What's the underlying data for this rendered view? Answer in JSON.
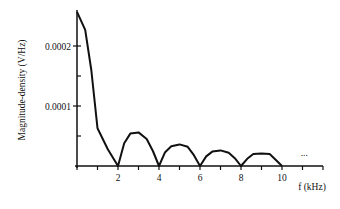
{
  "chart_data": {
    "type": "line",
    "title": "",
    "xlabel": "f (kHz)",
    "ylabel": "Magnitude-density (V/Hz)",
    "xlim": [
      0,
      12
    ],
    "ylim": [
      0,
      0.00026
    ],
    "grid": false,
    "legend": null,
    "x_ticks": [
      0,
      1,
      2,
      3,
      4,
      5,
      6,
      7,
      8,
      9,
      10,
      11,
      12
    ],
    "x_tick_labels": [
      {
        "value": 2,
        "label": "2"
      },
      {
        "value": 4,
        "label": "4"
      },
      {
        "value": 6,
        "label": "6"
      },
      {
        "value": 8,
        "label": "8"
      },
      {
        "value": 10,
        "label": "10"
      }
    ],
    "y_ticks": [
      0,
      5e-05,
      0.0001,
      0.00015,
      0.0002
    ],
    "y_tick_labels": [
      {
        "value": 0.0001,
        "label": "0.0001"
      },
      {
        "value": 0.0002,
        "label": "0.0002"
      }
    ],
    "annotations": [
      {
        "text": "...",
        "x": 10.6,
        "y": 2e-05
      }
    ],
    "series": [
      {
        "name": "magnitude density",
        "x": [
          0,
          0.4,
          0.7,
          1.0,
          1.5,
          2.0,
          2.3,
          2.6,
          3.0,
          3.4,
          3.7,
          4.0,
          4.3,
          4.6,
          5.0,
          5.4,
          5.7,
          6.0,
          6.3,
          6.6,
          7.0,
          7.4,
          7.7,
          8.0,
          8.3,
          8.6,
          9.0,
          9.4,
          9.7,
          10.0
        ],
        "values": [
          0.000257,
          0.000227,
          0.00016,
          6.3e-05,
          2.8e-05,
          0.0,
          3.8e-05,
          5.4e-05,
          5.6e-05,
          4.5e-05,
          2.5e-05,
          0.0,
          2.3e-05,
          3.3e-05,
          3.6e-05,
          3.2e-05,
          1.8e-05,
          0.0,
          1.6e-05,
          2.4e-05,
          2.6e-05,
          2.2e-05,
          1.3e-05,
          0.0,
          1.2e-05,
          2e-05,
          2.1e-05,
          2e-05,
          1e-05,
          0.0
        ]
      }
    ]
  }
}
